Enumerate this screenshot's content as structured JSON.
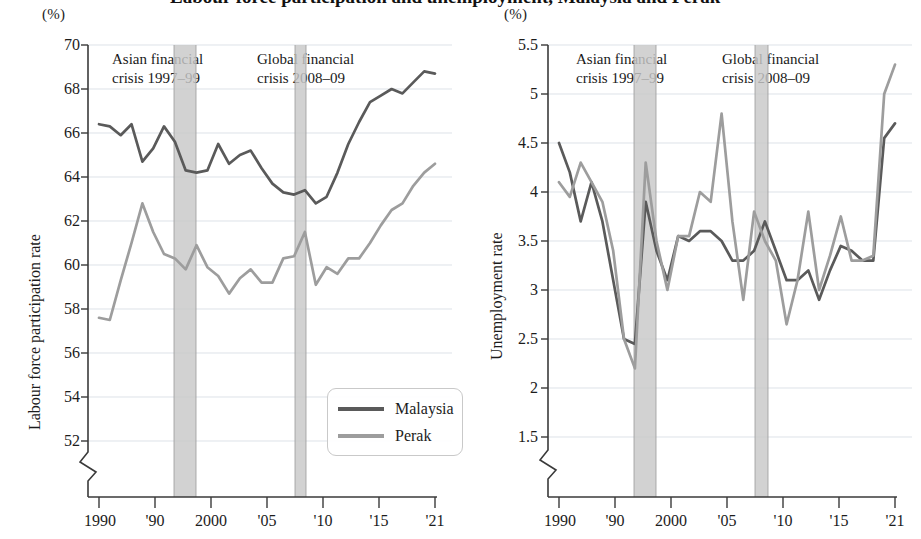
{
  "figure": {
    "cropped_title_fragment": "Labour force participation and unemployment, Malaysia and Perak",
    "unit_label": "(%)"
  },
  "colors": {
    "series_malaysia": "#5a5a5a",
    "series_perak": "#9d9d9d",
    "crisis_band": "#c8c8c8",
    "gridline": "#cfd6de",
    "axis": "#3a3a3a"
  },
  "legend": {
    "position": "inside-bottom-right-left-panel",
    "items": [
      {
        "label": "Malaysia",
        "color": "#5a5a5a"
      },
      {
        "label": "Perak",
        "color": "#9d9d9d"
      }
    ]
  },
  "annotations": [
    {
      "id": "asian-crisis",
      "line1": "Asian financial",
      "line2": "crisis 1997–99",
      "band_start": 1997,
      "band_end": 1999
    },
    {
      "id": "global-crisis",
      "line1": "Global financial",
      "line2": "crisis 2008–09",
      "band_start": 2008,
      "band_end": 2009
    }
  ],
  "chart_data": [
    {
      "id": "labour-force-participation",
      "type": "line",
      "title": "",
      "xlabel": "",
      "ylabel": "Labour force participation rate",
      "unit": "(%)",
      "ylim": [
        51,
        70
      ],
      "yticks": [
        52,
        54,
        56,
        58,
        60,
        62,
        64,
        66,
        68,
        70
      ],
      "axis_break": true,
      "grid": true,
      "xlim": [
        1990,
        2021
      ],
      "xticks": [
        1990,
        1995,
        2000,
        2005,
        2010,
        2015,
        2021
      ],
      "xticklabels": [
        "1990",
        "'90",
        "2000",
        "'05",
        "'10",
        "'15",
        "'21"
      ],
      "x": [
        1990,
        1991,
        1992,
        1993,
        1994,
        1995,
        1996,
        1997,
        1998,
        1999,
        2000,
        2001,
        2002,
        2003,
        2004,
        2005,
        2006,
        2007,
        2008,
        2009,
        2010,
        2011,
        2012,
        2013,
        2014,
        2015,
        2016,
        2017,
        2018,
        2019,
        2020,
        2021
      ],
      "series": [
        {
          "name": "Malaysia",
          "color": "#5a5a5a",
          "values": [
            66.4,
            66.3,
            65.9,
            66.4,
            64.7,
            65.3,
            66.3,
            65.6,
            64.3,
            64.2,
            64.3,
            65.5,
            64.6,
            65.0,
            65.2,
            64.4,
            63.7,
            63.3,
            63.2,
            63.4,
            62.8,
            63.1,
            64.2,
            65.5,
            66.5,
            67.4,
            67.7,
            68.0,
            67.8,
            68.3,
            68.8,
            68.7
          ]
        },
        {
          "name": "Perak",
          "color": "#9d9d9d",
          "values": [
            57.6,
            57.5,
            59.3,
            61.0,
            62.8,
            61.5,
            60.5,
            60.3,
            59.8,
            60.9,
            59.9,
            59.5,
            58.7,
            59.4,
            59.8,
            59.2,
            59.2,
            60.3,
            60.4,
            61.5,
            59.1,
            59.9,
            59.6,
            60.3,
            60.3,
            61.0,
            61.8,
            62.5,
            62.8,
            63.6,
            64.2,
            64.6
          ]
        }
      ]
    },
    {
      "id": "unemployment",
      "type": "line",
      "title": "",
      "xlabel": "",
      "ylabel": "Unemployment rate",
      "unit": "(%)",
      "ylim": [
        1.3,
        5.5
      ],
      "yticks": [
        1.5,
        2.0,
        2.5,
        3.0,
        3.5,
        4.0,
        4.5,
        5.0,
        5.5
      ],
      "axis_break": true,
      "grid": true,
      "xlim": [
        1990,
        2021
      ],
      "xticks": [
        1990,
        1995,
        2000,
        2005,
        2010,
        2015,
        2021
      ],
      "xticklabels": [
        "1990",
        "'90",
        "2000",
        "'05",
        "'10",
        "'15",
        "'21"
      ],
      "x": [
        1990,
        1991,
        1992,
        1993,
        1994,
        1995,
        1996,
        1997,
        1998,
        1999,
        2000,
        2001,
        2002,
        2003,
        2004,
        2005,
        2006,
        2007,
        2008,
        2009,
        2010,
        2011,
        2012,
        2013,
        2014,
        2015,
        2016,
        2017,
        2018,
        2019,
        2020,
        2021
      ],
      "series": [
        {
          "name": "Malaysia",
          "color": "#5a5a5a",
          "values": [
            4.5,
            4.2,
            3.7,
            4.1,
            3.7,
            3.1,
            2.5,
            2.45,
            3.9,
            3.4,
            3.1,
            3.55,
            3.5,
            3.6,
            3.6,
            3.5,
            3.3,
            3.3,
            3.4,
            3.7,
            3.4,
            3.1,
            3.1,
            3.2,
            2.9,
            3.2,
            3.45,
            3.4,
            3.3,
            3.3,
            4.55,
            4.7
          ]
        },
        {
          "name": "Perak",
          "color": "#9d9d9d",
          "values": [
            4.1,
            3.95,
            4.3,
            4.1,
            3.9,
            3.4,
            2.5,
            2.2,
            4.3,
            3.5,
            3.0,
            3.55,
            3.55,
            4.0,
            3.9,
            4.8,
            3.7,
            2.9,
            3.8,
            3.5,
            3.3,
            2.65,
            3.1,
            3.8,
            3.0,
            3.35,
            3.75,
            3.3,
            3.3,
            3.35,
            5.0,
            5.3
          ]
        }
      ]
    }
  ]
}
